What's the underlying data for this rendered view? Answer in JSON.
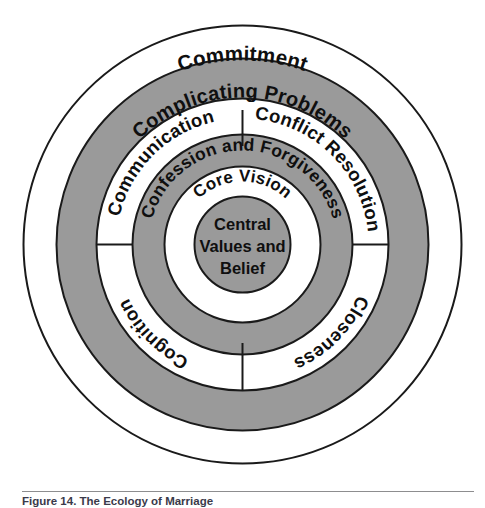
{
  "figure": {
    "type": "concentric-rings-diagram",
    "caption_text": "Figure 14. The Ecology of Marriage",
    "colors": {
      "ring_fill_gray": "#9a9a9a",
      "ring_fill_white": "#ffffff",
      "stroke": "#1a1a1a",
      "text": "#0f0f0f",
      "caption_rule": "#8d8d8f",
      "page_background": "#ffffff"
    },
    "center": {
      "label_lines": [
        "Central",
        "Values and",
        "Belief"
      ],
      "fill": "gray"
    },
    "rings": [
      {
        "index": 1,
        "label": "Core Vision",
        "fill": "white",
        "position": "top-arc",
        "divided": false
      },
      {
        "index": 2,
        "label": "Confession and Forgiveness",
        "fill": "gray",
        "position": "top-arc",
        "divided": false
      },
      {
        "index": 3,
        "fill": "white",
        "divided": true,
        "segments": [
          {
            "label": "Communication",
            "position": "upper-left"
          },
          {
            "label": "Conflict Resolution",
            "position": "upper-right"
          },
          {
            "label": "Cognition",
            "position": "lower-left"
          },
          {
            "label": "Closeness",
            "position": "lower-right"
          }
        ]
      },
      {
        "index": 4,
        "label": "Complicating Problems",
        "fill": "gray",
        "position": "top-arc",
        "divided": false
      },
      {
        "index": 5,
        "label": "Commitment",
        "fill": "white",
        "position": "top-arc",
        "divided": false
      }
    ]
  }
}
